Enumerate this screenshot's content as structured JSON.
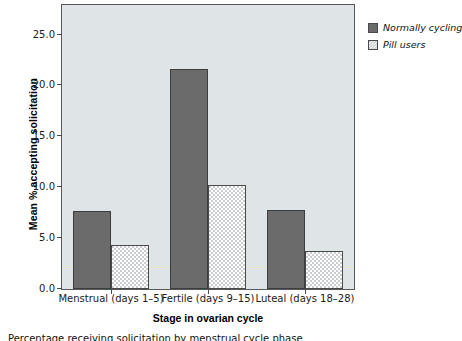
{
  "chart_data": {
    "type": "bar",
    "title": "",
    "xlabel": "Stage in ovarian cycle",
    "ylabel": "Mean % accepting solicitation",
    "categories": [
      "Menstrual (days 1–5)",
      "Fertile (days 9–15)",
      "Luteal (days 18–28)"
    ],
    "series": [
      {
        "name": "Normally cycling",
        "values": [
          7.7,
          21.6,
          7.8
        ],
        "color": "#6b6b6b"
      },
      {
        "name": "Pill users",
        "values": [
          4.3,
          10.2,
          3.7
        ],
        "color": "#c9cdd0"
      }
    ],
    "ylim": [
      0,
      27.8
    ],
    "yticks": [
      0.0,
      5.0,
      10.0,
      15.0,
      20.0,
      25.0
    ],
    "ytick_labels": [
      "0.0",
      "5.0",
      "10.0",
      "15.0",
      "20.0",
      "25.0"
    ],
    "grid": false,
    "legend_position": "right",
    "annotations": [
      {
        "name": "reference-line",
        "value": 2.1,
        "color": "#e8e9c8"
      }
    ],
    "plot_background": "#dfe4e7",
    "axis_color": "#58595b"
  },
  "axes": {
    "y_title": "Mean % accepting solicitation",
    "x_title": "Stage in ovarian cycle"
  },
  "legend": {
    "items": [
      {
        "label": "Normally cycling",
        "style": "solid-dark"
      },
      {
        "label": "Pill users",
        "style": "checkered-light"
      }
    ]
  },
  "caption": {
    "text": "Percentage receiving solicitation by menstrual cycle phase"
  }
}
